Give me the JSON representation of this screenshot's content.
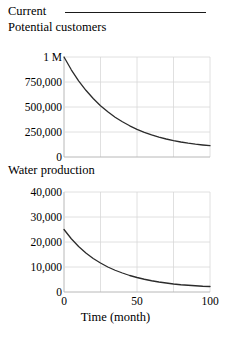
{
  "legend": {
    "label": "Current",
    "line_color": "#1a1a1a"
  },
  "axis_label": {
    "x": "Time (month)"
  },
  "style": {
    "grid_color": "#d8d8d8",
    "axis_color": "#b8b8b8",
    "curve_color": "#2b2b2b",
    "text_color": "#000000"
  },
  "chart_data": [
    {
      "type": "line",
      "title": "Potential customers",
      "xlabel": "Time (month)",
      "ylabel": "",
      "xlim": [
        0,
        100
      ],
      "ylim": [
        0,
        1000000
      ],
      "grid": true,
      "legend_position": "top",
      "xticks": [
        0,
        50,
        100
      ],
      "xticklabels": [
        "0",
        "50",
        "100"
      ],
      "yticks": [
        0,
        250000,
        500000,
        750000,
        1000000
      ],
      "yticklabels": [
        "0",
        "250,000",
        "500,000",
        "750,000",
        "1 M"
      ],
      "gridlines_x": [
        0,
        25,
        50,
        75,
        100
      ],
      "gridlines_y": [
        0,
        250000,
        500000,
        750000,
        1000000
      ],
      "series": [
        {
          "name": "Current",
          "color": "#2b2b2b",
          "x": [
            0,
            5,
            10,
            15,
            20,
            25,
            30,
            35,
            40,
            45,
            50,
            55,
            60,
            65,
            70,
            75,
            80,
            85,
            90,
            95,
            100
          ],
          "y": [
            1000000,
            872000,
            762000,
            667000,
            585000,
            513000,
            452000,
            398000,
            352000,
            312000,
            277000,
            247000,
            222000,
            199000,
            180000,
            164000,
            150000,
            138000,
            128000,
            120000,
            113000
          ]
        }
      ]
    },
    {
      "type": "line",
      "title": "Water production",
      "xlabel": "Time (month)",
      "ylabel": "",
      "xlim": [
        0,
        100
      ],
      "ylim": [
        0,
        40000
      ],
      "grid": true,
      "legend_position": "top",
      "xticks": [
        0,
        50,
        100
      ],
      "xticklabels": [
        "0",
        "50",
        "100"
      ],
      "yticks": [
        0,
        10000,
        20000,
        30000,
        40000
      ],
      "yticklabels": [
        "0",
        "10,000",
        "20,000",
        "30,000",
        "40,000"
      ],
      "gridlines_x": [
        0,
        25,
        50,
        75,
        100
      ],
      "gridlines_y": [
        0,
        10000,
        20000,
        30000,
        40000
      ],
      "series": [
        {
          "name": "Current",
          "color": "#2b2b2b",
          "x": [
            0,
            5,
            10,
            15,
            20,
            25,
            30,
            35,
            40,
            45,
            50,
            55,
            60,
            65,
            70,
            75,
            80,
            85,
            90,
            95,
            100
          ],
          "y": [
            25000,
            21300,
            18200,
            15600,
            13400,
            11600,
            10000,
            8700,
            7600,
            6600,
            5800,
            5100,
            4500,
            4000,
            3600,
            3200,
            2900,
            2700,
            2500,
            2300,
            2200
          ]
        }
      ]
    }
  ]
}
